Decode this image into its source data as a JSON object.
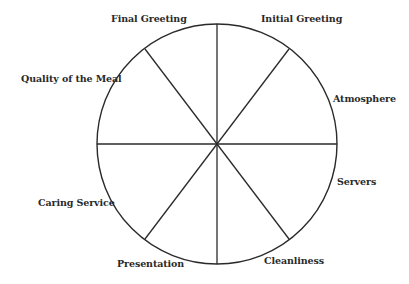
{
  "diagram": {
    "type": "segmented-wheel",
    "segment_count": 8,
    "colors": {
      "stroke": "#2a2a2a",
      "text": "#2a2a2a",
      "background": "#ffffff"
    },
    "circle": {
      "cx": 217,
      "cy": 144,
      "r": 120
    },
    "segments": [
      {
        "label": "Initial Greeting"
      },
      {
        "label": "Atmosphere"
      },
      {
        "label": "Servers"
      },
      {
        "label": "Cleanliness"
      },
      {
        "label": "Presentation"
      },
      {
        "label": "Caring Service"
      },
      {
        "label": "Quality of the Meal"
      },
      {
        "label": "Final Greeting"
      }
    ]
  }
}
